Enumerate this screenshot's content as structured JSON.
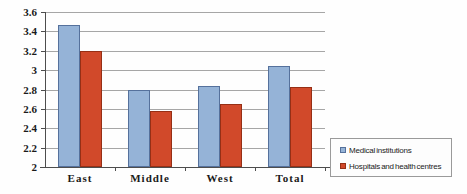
{
  "chart_data": {
    "type": "bar",
    "title": "",
    "xlabel": "",
    "ylabel": "",
    "categories": [
      "East",
      "Middle",
      "West",
      "Total"
    ],
    "series": [
      {
        "name": "Medical institutions",
        "color": "#95b3d7",
        "border_color": "#55719c",
        "values": [
          3.47,
          2.8,
          2.84,
          3.04
        ]
      },
      {
        "name": "Hospitals and health centres",
        "color": "#d1492a",
        "border_color": "#96globals2f15",
        "values": [
          3.2,
          2.58,
          2.65,
          2.83
        ]
      }
    ],
    "ylim": [
      2,
      3.6
    ],
    "ytick_step": 0.2,
    "ytick_labels": [
      "2",
      "2.2",
      "2.4",
      "2.6",
      "2.8",
      "3",
      "3.2",
      "3.4",
      "3.6"
    ],
    "grid": true,
    "gridline_color": "#a6a6a6",
    "axis_color": "#4d4d4d",
    "legend_position": "right-bottom"
  }
}
